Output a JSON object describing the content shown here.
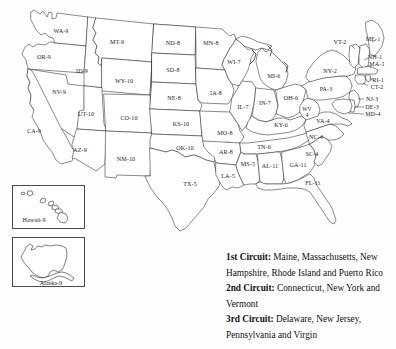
{
  "map": {
    "title": "United States Federal Judicial Circuits Map",
    "state_labels": [
      {
        "code": "WA-9",
        "x": 61,
        "y": 31,
        "name": "washington"
      },
      {
        "code": "OR-9",
        "x": 44,
        "y": 57,
        "name": "oregon"
      },
      {
        "code": "ID-9",
        "x": 82,
        "y": 71,
        "name": "idaho"
      },
      {
        "code": "MT-9",
        "x": 117,
        "y": 42,
        "name": "montana"
      },
      {
        "code": "NV-9",
        "x": 59,
        "y": 92,
        "name": "nevada"
      },
      {
        "code": "WY-10",
        "x": 124,
        "y": 81,
        "name": "wyoming"
      },
      {
        "code": "UT-10",
        "x": 86,
        "y": 114,
        "name": "utah"
      },
      {
        "code": "CA-9",
        "x": 34,
        "y": 131,
        "name": "california"
      },
      {
        "code": "AZ-9",
        "x": 80,
        "y": 150,
        "name": "arizona"
      },
      {
        "code": "CO-10",
        "x": 129,
        "y": 118,
        "name": "colorado"
      },
      {
        "code": "NM-10",
        "x": 126,
        "y": 159,
        "name": "new-mexico"
      },
      {
        "code": "ND-8",
        "x": 173,
        "y": 43,
        "name": "north-dakota"
      },
      {
        "code": "SD-8",
        "x": 173,
        "y": 70,
        "name": "south-dakota"
      },
      {
        "code": "NE-8",
        "x": 174,
        "y": 98,
        "name": "nebraska"
      },
      {
        "code": "KS-10",
        "x": 181,
        "y": 124,
        "name": "kansas"
      },
      {
        "code": "OK-10",
        "x": 185,
        "y": 148,
        "name": "oklahoma"
      },
      {
        "code": "TX-5",
        "x": 190,
        "y": 184,
        "name": "texas"
      },
      {
        "code": "MN-8",
        "x": 211,
        "y": 43,
        "name": "minnesota"
      },
      {
        "code": "IA-8",
        "x": 216,
        "y": 93,
        "name": "iowa"
      },
      {
        "code": "MO-8",
        "x": 225,
        "y": 133,
        "name": "missouri"
      },
      {
        "code": "AR-8",
        "x": 226,
        "y": 152,
        "name": "arkansas"
      },
      {
        "code": "LA-5",
        "x": 228,
        "y": 176,
        "name": "louisiana"
      },
      {
        "code": "WI-7",
        "x": 234,
        "y": 62,
        "name": "wisconsin"
      },
      {
        "code": "IL-7",
        "x": 243,
        "y": 107,
        "name": "illinois"
      },
      {
        "code": "MI-6",
        "x": 274,
        "y": 76,
        "name": "michigan"
      },
      {
        "code": "IN-7",
        "x": 265,
        "y": 103,
        "name": "indiana"
      },
      {
        "code": "OH-6",
        "x": 291,
        "y": 98,
        "name": "ohio"
      },
      {
        "code": "KY-6",
        "x": 281,
        "y": 125,
        "name": "kentucky"
      },
      {
        "code": "TN-6",
        "x": 264,
        "y": 147,
        "name": "tennessee"
      },
      {
        "code": "MS-5",
        "x": 248,
        "y": 164,
        "name": "mississippi"
      },
      {
        "code": "AL-11",
        "x": 270,
        "y": 166,
        "name": "alabama"
      },
      {
        "code": "GA-11",
        "x": 298,
        "y": 165,
        "name": "georgia"
      },
      {
        "code": "FL-11",
        "x": 313,
        "y": 183,
        "name": "florida"
      },
      {
        "code": "SC-4",
        "x": 312,
        "y": 154,
        "name": "south-carolina"
      },
      {
        "code": "NC-4",
        "x": 316,
        "y": 137,
        "name": "north-carolina"
      },
      {
        "code": "VA-4",
        "x": 323,
        "y": 121,
        "name": "virginia"
      },
      {
        "code": "PA-3",
        "x": 326,
        "y": 89,
        "name": "pennsylvania"
      },
      {
        "code": "NY-2",
        "x": 330,
        "y": 71,
        "name": "new-york"
      },
      {
        "code": "VT-2",
        "x": 340,
        "y": 42,
        "name": "vermont"
      },
      {
        "code": "ME-1",
        "x": 373,
        "y": 39,
        "name": "maine"
      },
      {
        "code": "NH-1",
        "x": 375,
        "y": 57,
        "name": "new-hampshire"
      },
      {
        "code": "MA-1",
        "x": 377,
        "y": 64,
        "name": "massachusetts"
      },
      {
        "code": "RI-1",
        "x": 378,
        "y": 80,
        "name": "rhode-island"
      },
      {
        "code": "CT-2",
        "x": 377,
        "y": 87,
        "name": "connecticut"
      },
      {
        "code": "NJ-3",
        "x": 372,
        "y": 99,
        "name": "new-jersey"
      },
      {
        "code": "DE-3",
        "x": 372,
        "y": 107,
        "name": "delaware"
      },
      {
        "code": "MD-4",
        "x": 373,
        "y": 114,
        "name": "maryland"
      }
    ],
    "west_virginia": {
      "code_line1": "WV",
      "code_line2": "4",
      "x": 307,
      "y": 113,
      "name": "west-virginia"
    },
    "insets": [
      {
        "label": "Hawaii-9",
        "name": "hawaii",
        "label_x": 34,
        "label_y": 219,
        "box": {
          "x": 12,
          "y": 185,
          "w": 73,
          "h": 44
        }
      },
      {
        "label": "Alaska-9",
        "name": "alaska",
        "label_x": 51,
        "label_y": 282,
        "box": {
          "x": 12,
          "y": 237,
          "w": 73,
          "h": 50
        }
      }
    ]
  },
  "legend": {
    "entries": [
      {
        "circuit": "1st Circuit:",
        "states": " Maine, Massachusetts, New Hampshire, Rhode Island and Puerto Rico"
      },
      {
        "circuit": "2nd Circuit:",
        "states": " Connecticut, New York and Vermont"
      },
      {
        "circuit": "3rd Circuit:",
        "states": " Delaware, New Jersey, Pennsylvania and Virgin"
      }
    ]
  }
}
